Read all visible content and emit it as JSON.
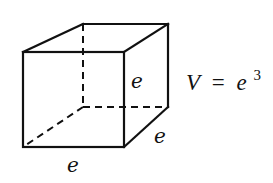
{
  "diagram": {
    "type": "cube-volume",
    "edge_labels": {
      "bottom": "e",
      "right_depth": "e",
      "front_right_height": "e"
    },
    "formula": {
      "lhs": "V",
      "equals": "=",
      "base": "e",
      "exponent": "3",
      "text": "V = e^3"
    },
    "vertices": {
      "front_top_left": [
        23,
        52
      ],
      "front_top_right": [
        124,
        52
      ],
      "front_bottom_left": [
        23,
        147
      ],
      "front_bottom_right": [
        124,
        147
      ],
      "back_top_left": [
        83,
        24
      ],
      "back_top_right": [
        168,
        24
      ],
      "back_bottom_left": [
        83,
        107
      ],
      "back_bottom_right": [
        168,
        107
      ]
    },
    "colors": {
      "stroke": "#111111",
      "background": "#ffffff"
    }
  }
}
